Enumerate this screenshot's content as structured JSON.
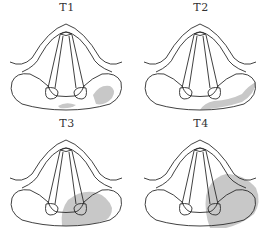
{
  "figure": {
    "panels": [
      {
        "label": "T1",
        "lesion": "posterior-commissure-and-right-arytenoid-small-patches"
      },
      {
        "label": "T2",
        "lesion": "right-posterior-margin-band"
      },
      {
        "label": "T3",
        "lesion": "right-arytenoid-region"
      },
      {
        "label": "T4",
        "lesion": "right-hemilarynx-extensive"
      }
    ],
    "colors": {
      "line": "#2b2b2b",
      "lesion": "#c8c8c8",
      "background": "#ffffff"
    }
  }
}
